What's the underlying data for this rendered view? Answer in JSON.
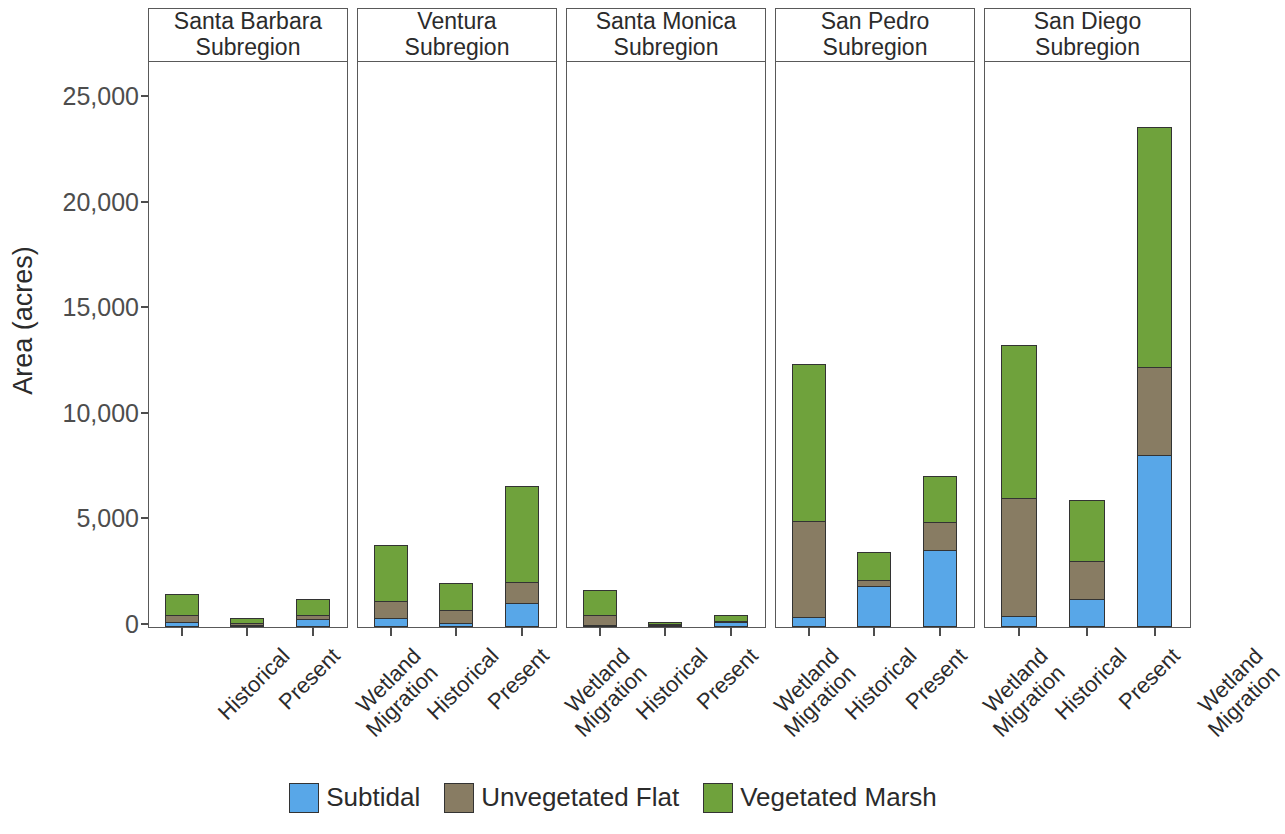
{
  "chart_data": {
    "type": "bar",
    "subtype": "stacked-bar-faceted",
    "title": "",
    "xlabel": "",
    "ylabel": "Area (acres)",
    "ylim": [
      0,
      26500
    ],
    "yticks": [
      0,
      5000,
      10000,
      15000,
      20000,
      25000
    ],
    "ytick_labels": [
      "0",
      "5,000",
      "10,000",
      "15,000",
      "20,000",
      "25,000"
    ],
    "grid": false,
    "legend_position": "bottom",
    "categories": [
      "Historical",
      "Present",
      "Wetland Migration"
    ],
    "facets": [
      "Santa Barbara Subregion",
      "Ventura Subregion",
      "Santa Monica Subregion",
      "San Pedro Subregion",
      "San Diego Subregion"
    ],
    "series": [
      {
        "name": "Subtidal",
        "color": "#58A7E8"
      },
      {
        "name": "Unvegetated Flat",
        "color": "#887C63"
      },
      {
        "name": "Vegetated Marsh",
        "color": "#6FA23C"
      }
    ],
    "panels": [
      {
        "facet": "Santa Barbara Subregion",
        "header_lines": [
          "Santa Barbara",
          "Subregion"
        ],
        "bars": [
          {
            "category": "Historical",
            "label_lines": [
              "Historical"
            ],
            "Subtidal": 240,
            "Unvegetated Flat": 330,
            "Vegetated Marsh": 990,
            "total": 1560
          },
          {
            "category": "Present",
            "label_lines": [
              "Present"
            ],
            "Subtidal": 100,
            "Unvegetated Flat": 90,
            "Vegetated Marsh": 260,
            "total": 450
          },
          {
            "category": "Wetland Migration",
            "label_lines": [
              "Wetland",
              "Migration"
            ],
            "Subtidal": 380,
            "Unvegetated Flat": 170,
            "Vegetated Marsh": 760,
            "total": 1310
          }
        ]
      },
      {
        "facet": "Ventura Subregion",
        "header_lines": [
          "Ventura",
          "Subregion"
        ],
        "bars": [
          {
            "category": "Historical",
            "label_lines": [
              "Historical"
            ],
            "Subtidal": 430,
            "Unvegetated Flat": 800,
            "Vegetated Marsh": 2650,
            "total": 3880
          },
          {
            "category": "Present",
            "label_lines": [
              "Present"
            ],
            "Subtidal": 190,
            "Unvegetated Flat": 620,
            "Vegetated Marsh": 1280,
            "total": 2090
          },
          {
            "category": "Wetland Migration",
            "label_lines": [
              "Wetland",
              "Migration"
            ],
            "Subtidal": 1140,
            "Unvegetated Flat": 990,
            "Vegetated Marsh": 4540,
            "total": 6670
          }
        ]
      },
      {
        "facet": "Santa Monica Subregion",
        "header_lines": [
          "Santa Monica",
          "Subregion"
        ],
        "bars": [
          {
            "category": "Historical",
            "label_lines": [
              "Historical"
            ],
            "Subtidal": 60,
            "Unvegetated Flat": 460,
            "Vegetated Marsh": 1180,
            "total": 1700
          },
          {
            "category": "Present",
            "label_lines": [
              "Present"
            ],
            "Subtidal": 40,
            "Unvegetated Flat": 40,
            "Vegetated Marsh": 30,
            "total": 110
          },
          {
            "category": "Wetland Migration",
            "label_lines": [
              "Wetland",
              "Migration"
            ],
            "Subtidal": 220,
            "Unvegetated Flat": 40,
            "Vegetated Marsh": 300,
            "total": 560
          }
        ]
      },
      {
        "facet": "San Pedro Subregion",
        "header_lines": [
          "San Pedro",
          "Subregion"
        ],
        "bars": [
          {
            "category": "Historical",
            "label_lines": [
              "Historical"
            ],
            "Subtidal": 480,
            "Unvegetated Flat": 4540,
            "Vegetated Marsh": 7430,
            "total": 12450
          },
          {
            "category": "Present",
            "label_lines": [
              "Present"
            ],
            "Subtidal": 1940,
            "Unvegetated Flat": 280,
            "Vegetated Marsh": 1330,
            "total": 3550
          },
          {
            "category": "Wetland Migration",
            "label_lines": [
              "Wetland",
              "Migration"
            ],
            "Subtidal": 3650,
            "Unvegetated Flat": 1330,
            "Vegetated Marsh": 2180,
            "total": 7160
          }
        ]
      },
      {
        "facet": "San Diego Subregion",
        "header_lines": [
          "San Diego",
          "Subregion"
        ],
        "bars": [
          {
            "category": "Historical",
            "label_lines": [
              "Historical"
            ],
            "Subtidal": 520,
            "Unvegetated Flat": 5590,
            "Vegetated Marsh": 7230,
            "total": 13340
          },
          {
            "category": "Present",
            "label_lines": [
              "Present"
            ],
            "Subtidal": 1330,
            "Unvegetated Flat": 1800,
            "Vegetated Marsh": 2870,
            "total": 6000
          },
          {
            "category": "Wetland Migration",
            "label_lines": [
              "Wetland",
              "Migration"
            ],
            "Subtidal": 8150,
            "Unvegetated Flat": 4170,
            "Vegetated Marsh": 11350,
            "total": 23670
          }
        ]
      }
    ]
  },
  "axis": {
    "y_title": "Area (acres)"
  },
  "legend": {
    "items": [
      {
        "label": "Subtidal",
        "color": "#58A7E8"
      },
      {
        "label": "Unvegetated Flat",
        "color": "#887C63"
      },
      {
        "label": "Vegetated Marsh",
        "color": "#6FA23C"
      }
    ]
  }
}
